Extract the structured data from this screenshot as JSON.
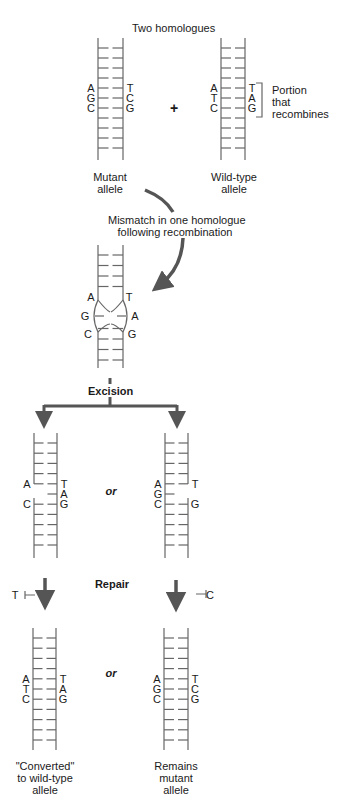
{
  "title": "Two homologues",
  "plus": "+",
  "mutant_label": [
    "Mutant",
    "allele"
  ],
  "wildtype_label": [
    "Wild-type",
    "allele"
  ],
  "portion_label": [
    "Portion",
    "that",
    "recombines"
  ],
  "mismatch_label": [
    "Mismatch in one homologue",
    "following recombination"
  ],
  "excision_label": "Excision",
  "repair_label": "Repair",
  "or_label": "or",
  "converted_label": [
    "\"Converted\"",
    "to wild-type",
    "allele"
  ],
  "remains_label": [
    "Remains",
    "mutant",
    "allele"
  ],
  "mutant": {
    "left": [
      "A",
      "G",
      "C"
    ],
    "right": [
      "T",
      "C",
      "G"
    ]
  },
  "wildtype": {
    "left": [
      "A",
      "T",
      "C"
    ],
    "right": [
      "T",
      "A",
      "G"
    ]
  },
  "heteroduplex": {
    "left": [
      "A",
      "G",
      "C"
    ],
    "right": [
      "T",
      "A",
      "G"
    ]
  },
  "excised_left": {
    "left": [
      "A",
      "",
      "C"
    ],
    "right": [
      "T",
      "A",
      "G"
    ]
  },
  "excised_right": {
    "left": [
      "A",
      "G",
      "C"
    ],
    "right": [
      "T",
      "",
      "G"
    ]
  },
  "repair_insert_left": "T",
  "repair_insert_right": "C",
  "final_left": {
    "left": [
      "A",
      "T",
      "C"
    ],
    "right": [
      "T",
      "A",
      "G"
    ]
  },
  "final_right": {
    "left": [
      "A",
      "G",
      "C"
    ],
    "right": [
      "T",
      "C",
      "G"
    ]
  },
  "colors": {
    "line": "#555555",
    "arrow": "#555555",
    "text": "#1a1a1a"
  }
}
